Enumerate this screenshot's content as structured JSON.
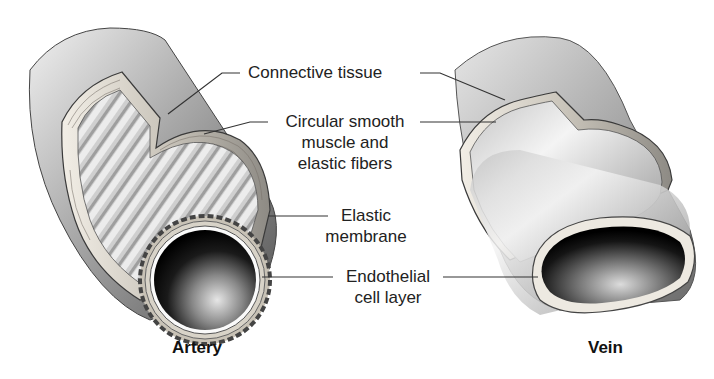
{
  "figure": {
    "type": "diagram"
  },
  "vessels": [
    {
      "id": "artery",
      "caption": "Artery"
    },
    {
      "id": "vein",
      "caption": "Vein"
    }
  ],
  "labels": {
    "connective_tissue": "Connective tissue",
    "circular_smooth_muscle_line1": "Circular smooth",
    "circular_smooth_muscle_line2": "muscle and",
    "circular_smooth_muscle_line3": "elastic fibers",
    "elastic_membrane_line1": "Elastic",
    "elastic_membrane_line2": "membrane",
    "endothelial_line1": "Endothelial",
    "endothelial_line2": "cell layer"
  },
  "colors": {
    "background": "#ffffff",
    "vessel_light": "#d9d9d9",
    "vessel_mid": "#9a9a9a",
    "vessel_dark": "#4a4a4a",
    "lumen": "#0a0a0a",
    "leader_line": "#333333",
    "text": "#222222"
  }
}
